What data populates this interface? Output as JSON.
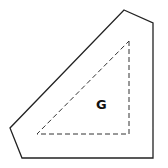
{
  "diagram": {
    "outer_shape": {
      "points": "124,10 153,23 153,158 22,158 10,128",
      "stroke": "#222222",
      "style": "solid"
    },
    "inner_triangle": {
      "points": "129,41 129,134 37,134",
      "stroke": "#333333",
      "style": "dashed"
    },
    "label": {
      "text": "G",
      "x": 100,
      "y": 108
    }
  }
}
